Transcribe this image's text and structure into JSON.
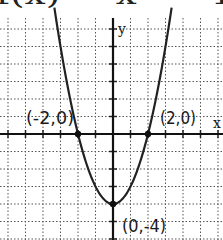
{
  "chart_data": {
    "type": "line",
    "title": "f(x) = x² − 4",
    "function": "x^2 - 4",
    "xlabel": "x",
    "ylabel": "y",
    "xlim": [
      -6.4,
      6.2
    ],
    "ylim": [
      -6.0,
      7.6
    ],
    "grid": true,
    "grid_style": "dotted",
    "x": [
      -3,
      -2.5,
      -2,
      -1.5,
      -1,
      -0.5,
      0,
      0.5,
      1,
      1.5,
      2,
      2.5,
      3
    ],
    "y": [
      5,
      2.25,
      0,
      -1.75,
      -3,
      -3.75,
      -4,
      -3.75,
      -3,
      -1.75,
      0,
      2.25,
      5
    ],
    "annotations": [
      {
        "label": "(-2,0)",
        "x": -2,
        "y": 0
      },
      {
        "label": "(2,0)",
        "x": 2,
        "y": 0
      },
      {
        "label": "(0,-4)",
        "x": 0,
        "y": -4
      }
    ]
  },
  "labels": {
    "x_axis": "x",
    "y_axis": "y",
    "point_left": "(-2,0)",
    "point_right": "(2,0)",
    "point_vertex": "(0,-4)",
    "title_fragment": "f(x) = x² − 4"
  }
}
